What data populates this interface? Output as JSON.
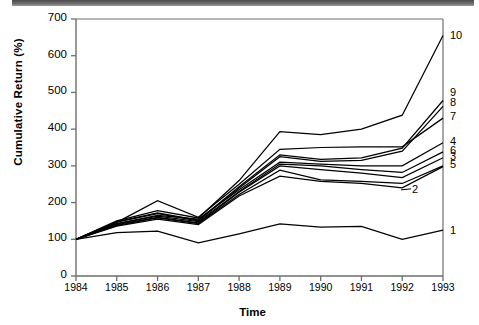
{
  "figure": {
    "has_scan_artifact_bar": true,
    "background": "#ffffff",
    "line_color": "#000000",
    "axis_color": "#6e6e6e"
  },
  "chart_data": {
    "type": "line",
    "title": "",
    "xlabel": "Time",
    "ylabel": "Cumulative Return (%)",
    "x": [
      1984,
      1985,
      1986,
      1987,
      1988,
      1989,
      1990,
      1991,
      1992,
      1993
    ],
    "xtick_labels": [
      "1984",
      "1985",
      "1986",
      "1987",
      "1988",
      "1989",
      "1990",
      "1991",
      "1992",
      "1993"
    ],
    "ytick_labels": [
      "0",
      "100",
      "200",
      "300",
      "400",
      "500",
      "600",
      "700"
    ],
    "ytick_values": [
      0,
      100,
      200,
      300,
      400,
      500,
      600,
      700
    ],
    "xlim": [
      1984,
      1993
    ],
    "ylim": [
      0,
      700
    ],
    "grid": false,
    "legend_position": "right-inline-labels",
    "series": [
      {
        "name": "10",
        "label": "10",
        "label_y_value": 650,
        "values": [
          100,
          150,
          178,
          158,
          260,
          393,
          385,
          400,
          438,
          655
        ]
      },
      {
        "name": "9",
        "label": "9",
        "label_y_value": 495,
        "values": [
          100,
          148,
          172,
          152,
          243,
          330,
          318,
          322,
          348,
          478
        ]
      },
      {
        "name": "8",
        "label": "8",
        "label_y_value": 468,
        "values": [
          100,
          147,
          170,
          150,
          240,
          325,
          312,
          315,
          340,
          462
        ]
      },
      {
        "name": "7",
        "label": "7",
        "label_y_value": 430,
        "values": [
          100,
          146,
          205,
          160,
          250,
          345,
          350,
          352,
          352,
          430
        ]
      },
      {
        "name": "4",
        "label": "4",
        "label_y_value": 363,
        "values": [
          100,
          143,
          165,
          155,
          235,
          310,
          305,
          300,
          300,
          363
        ]
      },
      {
        "name": "6",
        "label": "6",
        "label_y_value": 338,
        "values": [
          100,
          142,
          163,
          148,
          230,
          305,
          300,
          290,
          282,
          338
        ]
      },
      {
        "name": "3",
        "label": "3",
        "label_y_value": 322,
        "values": [
          100,
          140,
          160,
          145,
          228,
          300,
          290,
          280,
          268,
          322
        ]
      },
      {
        "name": "5",
        "label": "5",
        "label_y_value": 300,
        "values": [
          100,
          138,
          158,
          143,
          222,
          288,
          262,
          258,
          252,
          300
        ]
      },
      {
        "name": "2",
        "label": "2",
        "label_y_value": 232,
        "values": [
          100,
          136,
          155,
          140,
          218,
          272,
          258,
          252,
          240,
          298
        ]
      },
      {
        "name": "1",
        "label": "1",
        "label_y_value": 120,
        "values": [
          100,
          118,
          122,
          90,
          115,
          142,
          133,
          135,
          100,
          125
        ]
      }
    ],
    "n_series": 10,
    "start_value": 100,
    "note": "All series indexed to 100 at 1984; label '2' drawn inside the plot with a short leader line."
  }
}
